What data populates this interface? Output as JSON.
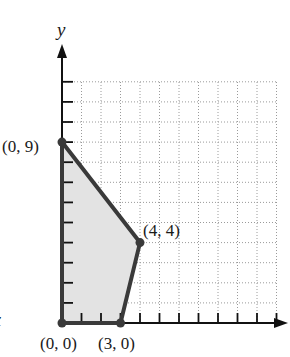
{
  "chart_data": {
    "type": "area",
    "title": "",
    "xlabel": "",
    "ylabel": "y",
    "xlim": [
      0,
      11
    ],
    "ylim": [
      0,
      12
    ],
    "grid": true,
    "grid_style": "dotted",
    "x_ticks": [
      1,
      2,
      3,
      4,
      5,
      6,
      7,
      8,
      9,
      10,
      11
    ],
    "y_ticks": [
      1,
      2,
      3,
      4,
      5,
      6,
      7,
      8,
      9,
      10,
      11,
      12
    ],
    "tick_labels_shown": false,
    "feasible_region": {
      "vertices": [
        [
          0,
          0
        ],
        [
          0,
          9
        ],
        [
          4,
          4
        ],
        [
          3,
          0
        ]
      ],
      "fill_color": "#e3e3e3",
      "edge_color": "#3a3a3a"
    },
    "points": [
      {
        "x": 0,
        "y": 9,
        "label": "(0, 9)"
      },
      {
        "x": 4,
        "y": 4,
        "label": "(4, 4)"
      },
      {
        "x": 0,
        "y": 0,
        "label": "(0, 0)"
      },
      {
        "x": 3,
        "y": 0,
        "label": "(3, 0)"
      }
    ],
    "legend": null
  },
  "labels": {
    "y_axis": "y",
    "left_edge_fragment": "x",
    "p09": "(0, 9)",
    "p44": "(4, 4)",
    "p00": "(0, 0)",
    "p30": "(3, 0)"
  },
  "colors": {
    "axis": "#111111",
    "grid": "#9a9a9a",
    "region_fill": "#e3e3e3",
    "region_edge": "#3a3a3a"
  }
}
